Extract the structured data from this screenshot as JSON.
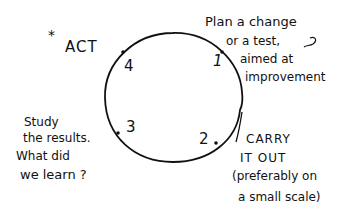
{
  "diagram": {
    "type": "cycle",
    "title_marker": "*",
    "act_label": "ACT",
    "steps": [
      {
        "number": "1",
        "text_lines": [
          "Plan a change",
          "or a test,",
          "aimed at",
          "improvement"
        ]
      },
      {
        "number": "2",
        "text_lines": [
          "CARRY",
          "IT OUT",
          "(preferably on",
          "a small scale)"
        ]
      },
      {
        "number": "3",
        "text_lines": [
          "Study",
          "the results.",
          "What did",
          "we learn ?"
        ]
      },
      {
        "number": "4",
        "text_lines": [
          "ACT"
        ]
      }
    ],
    "colors": {
      "ink": "#111111",
      "background": "#ffffff"
    }
  }
}
